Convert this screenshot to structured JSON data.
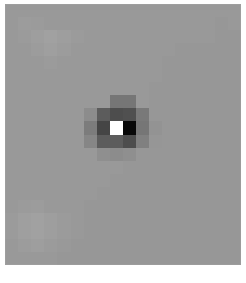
{
  "figure": {
    "kind": "pixelated-grayscale-image",
    "title": "",
    "caption": "",
    "frame": {
      "x": 5,
      "y": 4,
      "width": 236,
      "height": 261,
      "background_color": "#606060",
      "page_background_color": "#ffffff"
    },
    "colors": {
      "background_gray": "#606060",
      "background_gray_light": "#676767",
      "background_gray_dark": "#5b5b5b",
      "mid_dark": "#4a4a4a",
      "dark": "#3a3a3a",
      "darker": "#2b2b2b",
      "near_black": "#0a0a0a",
      "black": "#050505",
      "bright": "#c8c8c6",
      "bright_edge": "#bdbdbb"
    }
  },
  "chart_data": {
    "type": "heatmap",
    "title": "",
    "subtitle": "",
    "xlabel": "",
    "ylabel": "",
    "legend": [],
    "grid": false,
    "colormap": "grayscale",
    "value_range": [
      0,
      255
    ],
    "cell_width": 13.1,
    "cell_height": 13.1,
    "columns": 18,
    "rows": 20,
    "notable_features": [
      {
        "name": "center-bright-square",
        "x": 8,
        "y": 9,
        "w": 1,
        "h": 1,
        "gray": 200
      },
      {
        "name": "right-black-block",
        "x": 9,
        "y": 9,
        "w": 1,
        "h": 1,
        "gray": 5
      },
      {
        "name": "top-dark-block",
        "x": 8,
        "y": 7,
        "w": 1,
        "h": 1,
        "gray": 74
      },
      {
        "name": "left-dark-block",
        "x": 7,
        "y": 9,
        "w": 1,
        "h": 1,
        "gray": 43
      },
      {
        "name": "bottom-dark-block",
        "x": 8,
        "y": 10,
        "w": 1,
        "h": 1,
        "gray": 58
      },
      {
        "name": "halo-ring",
        "gray": 74
      }
    ],
    "pixels": [
      [
        96,
        96,
        96,
        96,
        96,
        96,
        96,
        96,
        96,
        96,
        96,
        96,
        96,
        96,
        96,
        96,
        96,
        96
      ],
      [
        96,
        98,
        97,
        96,
        96,
        96,
        96,
        96,
        96,
        96,
        96,
        96,
        96,
        96,
        96,
        96,
        95,
        96
      ],
      [
        96,
        97,
        99,
        101,
        99,
        97,
        96,
        96,
        96,
        96,
        96,
        96,
        96,
        96,
        96,
        96,
        95,
        95
      ],
      [
        96,
        96,
        98,
        100,
        98,
        96,
        96,
        96,
        96,
        96,
        96,
        96,
        96,
        95,
        95,
        95,
        95,
        95
      ],
      [
        96,
        96,
        96,
        97,
        96,
        96,
        96,
        96,
        96,
        96,
        96,
        96,
        95,
        95,
        95,
        95,
        95,
        95
      ],
      [
        96,
        96,
        96,
        96,
        96,
        96,
        96,
        96,
        96,
        96,
        96,
        96,
        95,
        95,
        95,
        95,
        95,
        95
      ],
      [
        96,
        96,
        96,
        96,
        96,
        96,
        96,
        96,
        96,
        96,
        96,
        95,
        95,
        95,
        95,
        95,
        95,
        95
      ],
      [
        96,
        96,
        96,
        96,
        96,
        96,
        96,
        96,
        74,
        74,
        96,
        95,
        95,
        95,
        95,
        95,
        95,
        95
      ],
      [
        96,
        96,
        96,
        96,
        96,
        96,
        88,
        58,
        48,
        50,
        76,
        95,
        95,
        95,
        95,
        95,
        95,
        95
      ],
      [
        96,
        96,
        96,
        96,
        96,
        96,
        78,
        43,
        200,
        5,
        74,
        92,
        95,
        95,
        95,
        95,
        95,
        95
      ],
      [
        96,
        96,
        96,
        96,
        96,
        96,
        84,
        58,
        58,
        48,
        80,
        94,
        95,
        95,
        95,
        95,
        95,
        95
      ],
      [
        96,
        96,
        96,
        96,
        96,
        96,
        96,
        90,
        88,
        90,
        95,
        95,
        95,
        95,
        95,
        95,
        95,
        95
      ],
      [
        96,
        96,
        96,
        96,
        96,
        96,
        96,
        96,
        96,
        95,
        95,
        95,
        95,
        95,
        95,
        95,
        95,
        95
      ],
      [
        96,
        96,
        96,
        96,
        96,
        96,
        96,
        96,
        95,
        95,
        95,
        95,
        95,
        95,
        95,
        95,
        95,
        95
      ],
      [
        96,
        96,
        96,
        96,
        96,
        96,
        96,
        95,
        95,
        95,
        95,
        95,
        95,
        95,
        95,
        95,
        95,
        95
      ],
      [
        96,
        97,
        98,
        96,
        96,
        96,
        95,
        95,
        95,
        95,
        95,
        95,
        95,
        95,
        95,
        95,
        95,
        95
      ],
      [
        97,
        100,
        101,
        99,
        97,
        96,
        95,
        95,
        95,
        95,
        95,
        95,
        95,
        95,
        95,
        95,
        95,
        95
      ],
      [
        97,
        100,
        101,
        99,
        97,
        96,
        95,
        95,
        95,
        95,
        95,
        95,
        95,
        95,
        95,
        95,
        95,
        95
      ],
      [
        96,
        98,
        99,
        97,
        96,
        95,
        95,
        95,
        95,
        95,
        95,
        95,
        95,
        95,
        95,
        95,
        95,
        95
      ],
      [
        96,
        96,
        96,
        96,
        95,
        95,
        95,
        95,
        95,
        95,
        95,
        95,
        95,
        95,
        95,
        95,
        95,
        95
      ]
    ]
  }
}
